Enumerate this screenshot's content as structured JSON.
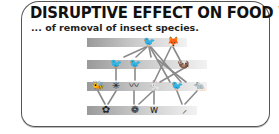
{
  "title": "DISRUPTIVE EFFECT ON FOOD WEBS ...",
  "subtitle": "... of removal of insect species.",
  "colors": {
    "frame": "#555555",
    "text": "#111111",
    "band_dark": "#9a9a9a",
    "band_light": "#f2f2f2",
    "lines": "#8a8a8a"
  },
  "food_web": {
    "levels": [
      {
        "name": "top-predators",
        "organisms": [
          {
            "id": "bird-of-prey",
            "icon": "🐦"
          },
          {
            "id": "fox",
            "icon": "🦊"
          }
        ]
      },
      {
        "name": "secondary-consumers",
        "organisms": [
          {
            "id": "bird-a",
            "icon": "🐦"
          },
          {
            "id": "bird-b",
            "icon": "🐦"
          },
          {
            "id": "mammal",
            "icon": "🦦"
          }
        ]
      },
      {
        "name": "primary-consumers",
        "organisms": [
          {
            "id": "bee",
            "icon": "🐝"
          },
          {
            "id": "insect",
            "icon": "✳"
          },
          {
            "id": "caterpillar",
            "icon": "〰"
          },
          {
            "id": "rabbit",
            "icon": "🐇"
          },
          {
            "id": "bird-c",
            "icon": "🐦"
          },
          {
            "id": "small-mammal",
            "icon": "🐀"
          }
        ]
      },
      {
        "name": "producers",
        "organisms": [
          {
            "id": "flower",
            "icon": "✿"
          },
          {
            "id": "berry-bush",
            "icon": "❁"
          },
          {
            "id": "grass",
            "icon": "ᴡ"
          },
          {
            "id": "plant-stem",
            "icon": "⸝"
          }
        ]
      }
    ]
  }
}
